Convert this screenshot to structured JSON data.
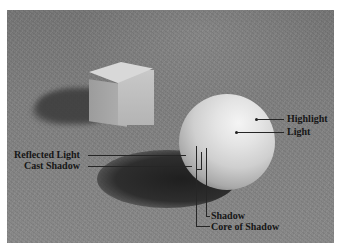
{
  "image": {
    "description": "Shading study photograph: white cube and white sphere on a textured surface with labeled light and shadow regions",
    "background_color": "#ffffff",
    "photo_tone": "#808080"
  },
  "labels": {
    "highlight": "Highlight",
    "light": "Light",
    "reflected_light": "Reflected Light",
    "cast_shadow": "Cast Shadow",
    "shadow": "Shadow",
    "core_of_shadow": "Core of Shadow"
  }
}
